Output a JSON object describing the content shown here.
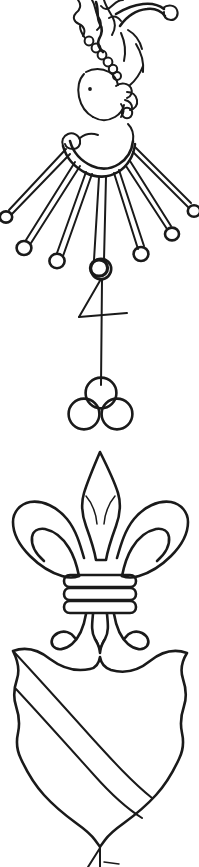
{
  "page": {
    "width": 199,
    "height": 867,
    "background_color": "#ffffff",
    "ink_color": "#1a1a1a",
    "medium": "pen-and-ink line drawing, scanned black-and-white, no text or labels present"
  },
  "figures": [
    {
      "id": "crest",
      "name": "Crest: plumed head with rayed collar",
      "region": {
        "x": 0,
        "y": 0,
        "width": 199,
        "height": 270
      },
      "parts": [
        {
          "name": "plume-spray",
          "label": "Feathered plume spray rising above the head, terminating in a small ball at upper right"
        },
        {
          "name": "beaded-cord",
          "label": "Beaded cord of seven small rings running diagonally down the left of the plume"
        },
        {
          "name": "head",
          "label": "Profile head facing right with a single dot eye"
        },
        {
          "name": "crescent-collar",
          "label": "Crescent collar beneath the head with a scroll loop at its left tip"
        },
        {
          "name": "rays",
          "label": "Seven radiating rays issuing from the collar, each tipped with an open ring"
        }
      ],
      "ray_count": 7,
      "bead_count": 7
    },
    {
      "id": "merchant-mark",
      "name": "Merchant's mark: figure four over three roundels",
      "region": {
        "x": 60,
        "y": 255,
        "width": 80,
        "height": 185
      },
      "parts": [
        {
          "name": "mark-ring",
          "label": "Open ring at the head of the mark"
        },
        {
          "name": "figure-four",
          "label": "Figure '4' formed by a diagonal, a horizontal crossbar and a long vertical stem"
        },
        {
          "name": "roundels",
          "label": "Three roundels arranged two-and-one (one above, two below)"
        }
      ],
      "roundel_count": 3,
      "mark_character": "4"
    },
    {
      "id": "fleur-de-lis",
      "name": "Fleur-de-lis",
      "region": {
        "x": 10,
        "y": 450,
        "width": 180,
        "height": 190
      },
      "parts": [
        {
          "name": "centre-petal",
          "label": "Tall lance-shaped central petal"
        },
        {
          "name": "side-petals",
          "label": "Two outward-curling side petals"
        },
        {
          "name": "binding-band",
          "label": "Horizontal binding band of three bars across the waist"
        },
        {
          "name": "lower-leaves",
          "label": "Two recurved lower leaves flanking a pointed base foot"
        }
      ],
      "band_bar_count": 3
    },
    {
      "id": "shield",
      "name": "Shield charged with a bend",
      "region": {
        "x": 5,
        "y": 638,
        "width": 190,
        "height": 229
      },
      "parts": [
        {
          "name": "shield-outline",
          "label": "Heater shield with scalloped flanks, indented chief and rounded lobed base"
        },
        {
          "name": "bend",
          "label": "A bend drawn as two parallel diagonal lines running from dexter chief to sinister base"
        },
        {
          "name": "base-tick",
          "label": "Small pen tick below the shield point"
        }
      ],
      "ordinary": "bend"
    }
  ]
}
